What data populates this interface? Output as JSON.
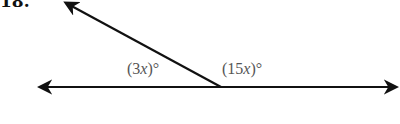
{
  "problem": {
    "number": "18."
  },
  "diagram": {
    "type": "linear-pair-angles",
    "line": {
      "from": [
        38,
        87
      ],
      "to": [
        398,
        87
      ],
      "arrows": "both"
    },
    "ray": {
      "from": [
        221,
        87
      ],
      "to": [
        64,
        2
      ],
      "arrow": true
    },
    "vertex": [
      221,
      87
    ],
    "angles": [
      {
        "id": "left",
        "label": "(3x)°",
        "coef": "3",
        "var": "x",
        "pos": [
          127,
          60
        ]
      },
      {
        "id": "right",
        "label": "(15x)°",
        "coef": "15",
        "var": "x",
        "pos": [
          222,
          60
        ]
      }
    ],
    "colors": {
      "line": "#111111",
      "label": "#555555"
    }
  }
}
